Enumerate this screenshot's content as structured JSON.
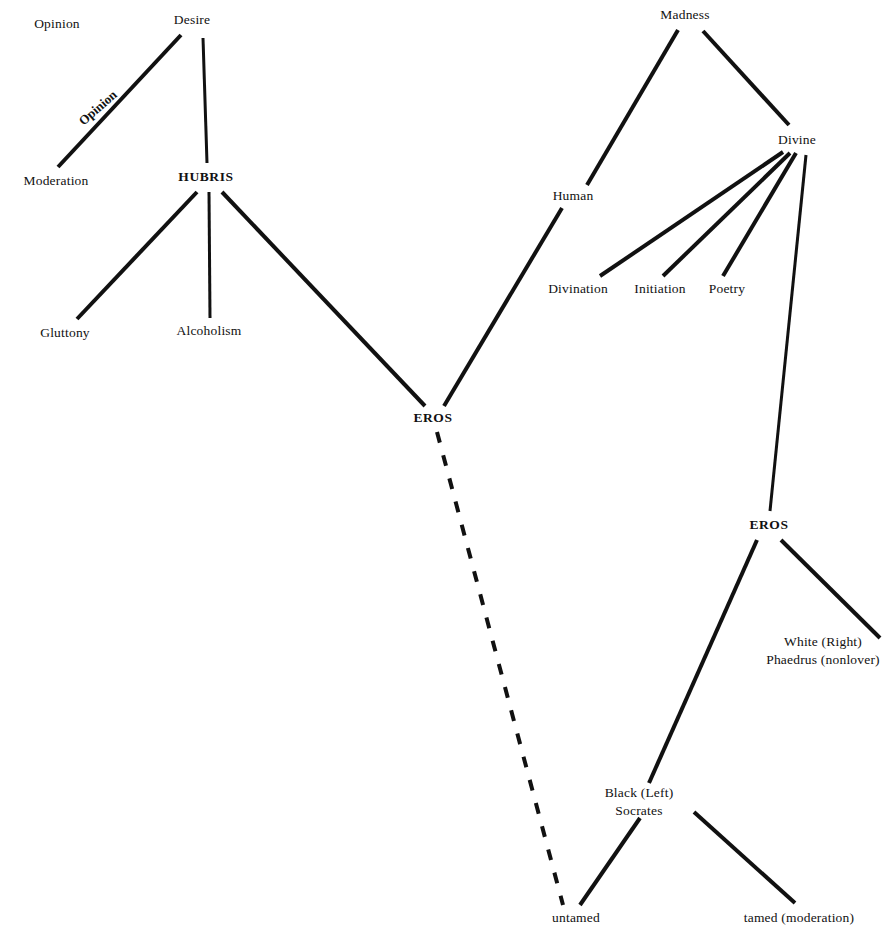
{
  "diagram": {
    "canvas": {
      "width": 896,
      "height": 940
    },
    "style": {
      "background": "#ffffff",
      "ink": "#111111",
      "solid_stroke": "#111111",
      "dashed_stroke": "#111111"
    },
    "nodes": [
      {
        "id": "opinion",
        "label": "Opinion",
        "x": 57,
        "y": 24,
        "bold": false
      },
      {
        "id": "desire",
        "label": "Desire",
        "x": 192,
        "y": 20,
        "bold": false
      },
      {
        "id": "moderation",
        "label": "Moderation",
        "x": 56,
        "y": 181,
        "bold": false
      },
      {
        "id": "hubris",
        "label": "HUBRIS",
        "x": 206,
        "y": 177,
        "bold": true
      },
      {
        "id": "gluttony",
        "label": "Gluttony",
        "x": 65,
        "y": 333,
        "bold": false
      },
      {
        "id": "alcoholism",
        "label": "Alcoholism",
        "x": 209,
        "y": 331,
        "bold": false
      },
      {
        "id": "madness",
        "label": "Madness",
        "x": 685,
        "y": 15,
        "bold": false
      },
      {
        "id": "divine",
        "label": "Divine",
        "x": 797,
        "y": 140,
        "bold": false
      },
      {
        "id": "human",
        "label": "Human",
        "x": 573,
        "y": 196,
        "bold": false
      },
      {
        "id": "divination",
        "label": "Divination",
        "x": 578,
        "y": 289,
        "bold": false
      },
      {
        "id": "initiation",
        "label": "Initiation",
        "x": 660,
        "y": 289,
        "bold": false
      },
      {
        "id": "poetry",
        "label": "Poetry",
        "x": 727,
        "y": 289,
        "bold": false
      },
      {
        "id": "eros_center",
        "label": "EROS",
        "x": 433,
        "y": 418,
        "bold": true
      },
      {
        "id": "eros_lower",
        "label": "EROS",
        "x": 769,
        "y": 525,
        "bold": true
      },
      {
        "id": "untamed",
        "label": "untamed",
        "x": 576,
        "y": 918,
        "bold": false
      },
      {
        "id": "tamed",
        "label": "tamed (moderation)",
        "x": 799,
        "y": 918,
        "bold": false
      }
    ],
    "multiline_nodes": [
      {
        "id": "white_right",
        "x": 823,
        "y": 651,
        "lines": [
          "White (Right)",
          "Phaedrus (nonlover)"
        ]
      },
      {
        "id": "black_left",
        "x": 639,
        "y": 802,
        "lines": [
          "Black (Left)",
          "Socrates"
        ]
      }
    ],
    "edge_labels": [
      {
        "id": "opinion_edge",
        "label": "Opinion",
        "x": 98,
        "y": 108,
        "rotation": -41
      }
    ],
    "edges": [
      {
        "id": "desire-moderation",
        "from": "Desire",
        "to": "Moderation",
        "x1": 181,
        "y1": 35,
        "x2": 58,
        "y2": 167,
        "style": "solid",
        "width": 4
      },
      {
        "id": "desire-hubris",
        "from": "Desire",
        "to": "HUBRIS",
        "x1": 203,
        "y1": 38,
        "x2": 207,
        "y2": 163,
        "style": "solid",
        "width": 3
      },
      {
        "id": "hubris-gluttony",
        "from": "HUBRIS",
        "to": "Gluttony",
        "x1": 197,
        "y1": 192,
        "x2": 77,
        "y2": 319,
        "style": "solid",
        "width": 4
      },
      {
        "id": "hubris-alcoholism",
        "from": "HUBRIS",
        "to": "Alcoholism",
        "x1": 209,
        "y1": 192,
        "x2": 210,
        "y2": 318,
        "style": "solid",
        "width": 3
      },
      {
        "id": "hubris-eros",
        "from": "HUBRIS",
        "to": "EROS",
        "x1": 222,
        "y1": 192,
        "x2": 425,
        "y2": 406,
        "style": "solid",
        "width": 4
      },
      {
        "id": "madness-human",
        "from": "Madness",
        "to": "Human",
        "x1": 678,
        "y1": 30,
        "x2": 587,
        "y2": 185,
        "style": "solid",
        "width": 4
      },
      {
        "id": "madness-divine",
        "from": "Madness",
        "to": "Divine",
        "x1": 703,
        "y1": 31,
        "x2": 789,
        "y2": 125,
        "style": "solid",
        "width": 4
      },
      {
        "id": "divine-divination",
        "from": "Divine",
        "to": "Divination",
        "x1": 783,
        "y1": 152,
        "x2": 600,
        "y2": 276,
        "style": "solid",
        "width": 4
      },
      {
        "id": "divine-initiation",
        "from": "Divine",
        "to": "Initiation",
        "x1": 790,
        "y1": 153,
        "x2": 663,
        "y2": 276,
        "style": "solid",
        "width": 4
      },
      {
        "id": "divine-poetry",
        "from": "Divine",
        "to": "Poetry",
        "x1": 796,
        "y1": 153,
        "x2": 723,
        "y2": 276,
        "style": "solid",
        "width": 4
      },
      {
        "id": "divine-eros",
        "from": "Divine",
        "to": "EROS",
        "x1": 806,
        "y1": 155,
        "x2": 770,
        "y2": 511,
        "style": "solid",
        "width": 3
      },
      {
        "id": "human-eros",
        "from": "Human",
        "to": "EROS",
        "x1": 562,
        "y1": 208,
        "x2": 444,
        "y2": 406,
        "style": "solid",
        "width": 4
      },
      {
        "id": "eros-untamed",
        "from": "EROS",
        "to": "untamed",
        "x1": 437,
        "y1": 432,
        "x2": 563,
        "y2": 905,
        "style": "dashed",
        "width": 4
      },
      {
        "id": "eros-black",
        "from": "EROS",
        "to": "Black (Left)",
        "x1": 757,
        "y1": 540,
        "x2": 649,
        "y2": 783,
        "style": "solid",
        "width": 4
      },
      {
        "id": "eros-white",
        "from": "EROS",
        "to": "White (Right)",
        "x1": 781,
        "y1": 540,
        "x2": 880,
        "y2": 638,
        "style": "solid",
        "width": 4
      },
      {
        "id": "black-untamed",
        "from": "Black (Left)",
        "to": "untamed",
        "x1": 640,
        "y1": 818,
        "x2": 580,
        "y2": 905,
        "style": "solid",
        "width": 4
      },
      {
        "id": "black-tamed",
        "from": "Black (Left)",
        "to": "tamed",
        "x1": 694,
        "y1": 812,
        "x2": 795,
        "y2": 903,
        "style": "solid",
        "width": 4
      }
    ]
  }
}
